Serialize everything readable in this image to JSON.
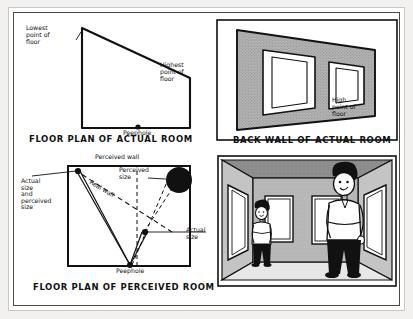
{
  "figure": {
    "background_color": "#ffffff",
    "frame_color": "#4a4a4a",
    "outer_frame_color": "#c9c8c6",
    "ink_color": "#111111",
    "wall_fill_color": "#a8a8a8"
  },
  "panels": {
    "actual_floor_plan": {
      "caption": "FLOOR PLAN OF ACTUAL ROOM",
      "labels": {
        "lowest_point": "Lowest\npoint of\nfloor",
        "highest_point": "Highest\npoint of\nfloor",
        "peephole": "Peephole"
      }
    },
    "back_wall": {
      "caption": "BACK WALL OF ACTUAL ROOM",
      "labels": {
        "high_point": "High\npoint of\nfloor"
      },
      "window_count": 2
    },
    "perceived_floor_plan": {
      "caption": "FLOOR PLAN OF PERCEIVED ROOM",
      "labels": {
        "perceived_wall": "Perceived wall",
        "real_wall": "Real wall",
        "perceived_size": "Perceived\nsize",
        "actual_and_perceived_size": "Actual\nsize\nand\nperceived\nsize",
        "actual_size": "Actual\nsize",
        "peephole": "Peephole"
      }
    },
    "photo_illustration": {
      "caption": "",
      "description": "Two people standing in the Ames room, one appearing small at left and one appearing large at right",
      "figure_count": 2,
      "window_count": 2
    }
  }
}
